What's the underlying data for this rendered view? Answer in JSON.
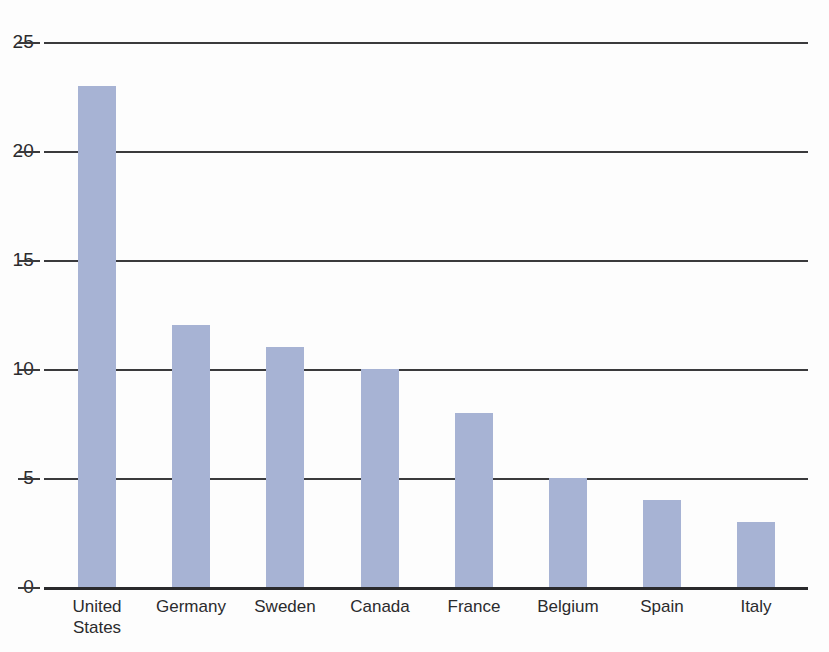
{
  "chart_data": {
    "type": "bar",
    "title": "",
    "subtitle": "",
    "xlabel": "",
    "ylabel": "",
    "categories": [
      "United\nStates",
      "Germany",
      "Sweden",
      "Canada",
      "France",
      "Belgium",
      "Spain",
      "Italy"
    ],
    "values": [
      23,
      12,
      11,
      10,
      8,
      5,
      4,
      3
    ],
    "series": [
      {
        "name": "",
        "values": [
          23,
          12,
          11,
          10,
          8,
          5,
          4,
          3
        ]
      }
    ],
    "ylim": [
      0,
      25
    ],
    "y_ticks": [
      0,
      5,
      10,
      15,
      20,
      25
    ],
    "y_tick_labels": [
      "0",
      "5",
      "10",
      "15",
      "20",
      "25"
    ],
    "grid": true,
    "grid_axis": "y",
    "legend": false,
    "legend_position": "none",
    "bar_color": "#a7b3d4",
    "axis_color": "#3a3a3c",
    "text_color": "#2b2b2d",
    "background": "#fdfdfd",
    "annotations": []
  }
}
